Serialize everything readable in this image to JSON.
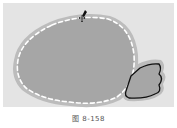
{
  "canvas": {
    "background": "#e4e4e4",
    "body_shape": {
      "fill": "#a6a6a6",
      "halo": "#bcbcbc",
      "stitch_color": "#ffffff"
    },
    "wing_shape": {
      "fill": "#a6a6a6",
      "halo": "#bcbcbc",
      "outline": "#111111"
    }
  },
  "cursor": {
    "icon": "move-cursor-icon"
  },
  "caption": {
    "text": "图 8-158"
  }
}
